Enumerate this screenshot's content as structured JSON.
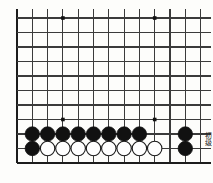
{
  "figure": {
    "kind": "go-board-diagram",
    "title": "",
    "caption_vertical": "初级",
    "background_color": "#fdfdfb",
    "line_color": "#3b3b3b",
    "border_color": "#1c1c1c",
    "black_stone_color": "#111111",
    "white_stone_color": "#ffffff",
    "white_stone_outline": "#1c1c1c"
  },
  "board": {
    "visible_columns": 13,
    "visible_rows": 11,
    "cell_width": 15.3,
    "cell_height": 14.5,
    "origin_x": 17,
    "origin_y": 18,
    "line_width": 1.1,
    "border_line_width": 2.6,
    "left_border": true,
    "bottom_border": true,
    "top_cropped": true,
    "right_cropped": true,
    "overhang_top": 9,
    "overhang_right": 10,
    "overhang_bottom": 0
  },
  "star_points": [
    {
      "col": 3,
      "row": 0,
      "label": "star-top-left"
    },
    {
      "col": 9,
      "row": 0,
      "label": "star-top-right"
    },
    {
      "col": 3,
      "row": 7,
      "label": "star-bottom-left"
    },
    {
      "col": 9,
      "row": 7,
      "label": "star-bottom-right"
    }
  ],
  "stone_radius": 7.2,
  "stones": [
    {
      "col": 1,
      "row": 8,
      "color": "black"
    },
    {
      "col": 2,
      "row": 8,
      "color": "black"
    },
    {
      "col": 3,
      "row": 8,
      "color": "black"
    },
    {
      "col": 4,
      "row": 8,
      "color": "black"
    },
    {
      "col": 5,
      "row": 8,
      "color": "black"
    },
    {
      "col": 6,
      "row": 8,
      "color": "black"
    },
    {
      "col": 7,
      "row": 8,
      "color": "black"
    },
    {
      "col": 8,
      "row": 8,
      "color": "black"
    },
    {
      "col": 11,
      "row": 8,
      "color": "black"
    },
    {
      "col": 1,
      "row": 9,
      "color": "black"
    },
    {
      "col": 2,
      "row": 9,
      "color": "white"
    },
    {
      "col": 3,
      "row": 9,
      "color": "white"
    },
    {
      "col": 4,
      "row": 9,
      "color": "white"
    },
    {
      "col": 5,
      "row": 9,
      "color": "white"
    },
    {
      "col": 6,
      "row": 9,
      "color": "white"
    },
    {
      "col": 7,
      "row": 9,
      "color": "white"
    },
    {
      "col": 8,
      "row": 9,
      "color": "white"
    },
    {
      "col": 9,
      "row": 9,
      "color": "white"
    },
    {
      "col": 11,
      "row": 9,
      "color": "black"
    }
  ]
}
